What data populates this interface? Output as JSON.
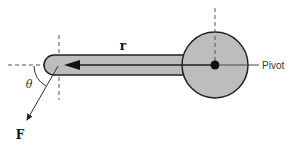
{
  "figure": {
    "type": "torque-lever-arm",
    "labels": {
      "r": "r",
      "force": "F",
      "angle": "θ",
      "pivot": "Pivot"
    },
    "colors": {
      "fill": "#bdbdbd",
      "stroke": "#222222",
      "dashed": "#555555",
      "background": "#ffffff"
    }
  }
}
